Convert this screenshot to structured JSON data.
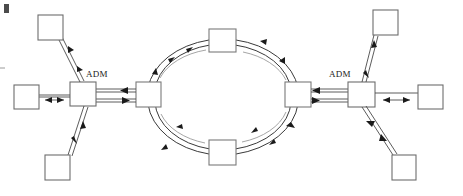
{
  "diagram": {
    "background_color": "#ffffff",
    "width": 463,
    "height": 196,
    "line_color": "#4a4a4a",
    "box_stroke_color": "#6d6d6d",
    "arrow_color": "#1a1a1a",
    "ring_arc_color": "#3a3a3a",
    "ring_arc_inner_color": "#8e8e8e",
    "labels": [
      {
        "id": "adm-left",
        "text": "ADM",
        "x": 97,
        "y": 74
      },
      {
        "id": "adm-right",
        "text": "ADM",
        "x": 340,
        "y": 74
      }
    ],
    "ring": {
      "type": "bidirectional-ring",
      "center_x": 224,
      "center_y": 97,
      "radius_x": 76,
      "radius_y": 58,
      "direction_outer": "counter-clockwise",
      "direction_inner": "clockwise",
      "node_count": 4
    },
    "ring_nodes": [
      {
        "id": "ring-node-top",
        "x": 209,
        "y": 29,
        "w": 27,
        "h": 23
      },
      {
        "id": "ring-node-right",
        "x": 285,
        "y": 82,
        "w": 26,
        "h": 25
      },
      {
        "id": "ring-node-bottom",
        "x": 209,
        "y": 140,
        "w": 27,
        "h": 25
      },
      {
        "id": "ring-node-left",
        "x": 136,
        "y": 82,
        "w": 25,
        "h": 25
      }
    ],
    "adm_nodes": [
      {
        "id": "adm-node-left",
        "x": 70,
        "y": 82,
        "w": 26,
        "h": 24
      },
      {
        "id": "adm-node-right",
        "x": 348,
        "y": 82,
        "w": 27,
        "h": 25
      }
    ],
    "client_nodes": [
      {
        "id": "client-top-left",
        "x": 38,
        "y": 15,
        "w": 25,
        "h": 25,
        "attached_to": "adm-node-left"
      },
      {
        "id": "client-mid-left",
        "x": 14,
        "y": 85,
        "w": 25,
        "h": 24,
        "attached_to": "adm-node-left"
      },
      {
        "id": "client-bottom-left",
        "x": 45,
        "y": 155,
        "w": 25,
        "h": 25,
        "attached_to": "adm-node-left"
      },
      {
        "id": "client-top-right",
        "x": 373,
        "y": 10,
        "w": 25,
        "h": 25,
        "attached_to": "adm-node-right"
      },
      {
        "id": "client-mid-right",
        "x": 418,
        "y": 85,
        "w": 25,
        "h": 24,
        "attached_to": "adm-node-right"
      },
      {
        "id": "client-bottom-right",
        "x": 392,
        "y": 155,
        "w": 24,
        "h": 25,
        "attached_to": "adm-node-right"
      }
    ],
    "links": [
      {
        "id": "link-adm-left-to-ring",
        "from": "adm-node-left",
        "to": "ring-node-left",
        "style": "dual-line",
        "directions": "bidirectional"
      },
      {
        "id": "link-adm-right-to-ring",
        "from": "adm-node-right",
        "to": "ring-node-right",
        "style": "dual-line",
        "directions": "bidirectional"
      },
      {
        "id": "link-adm-left-client-top",
        "from": "adm-node-left",
        "to": "client-top-left",
        "style": "dual-line",
        "directions": "bidirectional"
      },
      {
        "id": "link-adm-left-client-mid",
        "from": "adm-node-left",
        "to": "client-mid-left",
        "style": "single-line",
        "directions": "bidirectional"
      },
      {
        "id": "link-adm-left-client-bottom",
        "from": "adm-node-left",
        "to": "client-bottom-left",
        "style": "dual-line",
        "directions": "bidirectional"
      },
      {
        "id": "link-adm-right-client-top",
        "from": "adm-node-right",
        "to": "client-top-right",
        "style": "dual-line",
        "directions": "bidirectional"
      },
      {
        "id": "link-adm-right-client-mid",
        "from": "adm-node-right",
        "to": "client-mid-right",
        "style": "single-line",
        "directions": "bidirectional"
      },
      {
        "id": "link-adm-right-client-bottom",
        "from": "adm-node-right",
        "to": "client-bottom-right",
        "style": "dual-line",
        "directions": "bidirectional"
      }
    ],
    "corner_marks": [
      {
        "id": "corner-mark-top-left",
        "x": 4,
        "y": 4,
        "w": 5,
        "h": 8
      },
      {
        "id": "tick-mark-left",
        "x": 0,
        "y": 68,
        "w": 5
      }
    ]
  }
}
